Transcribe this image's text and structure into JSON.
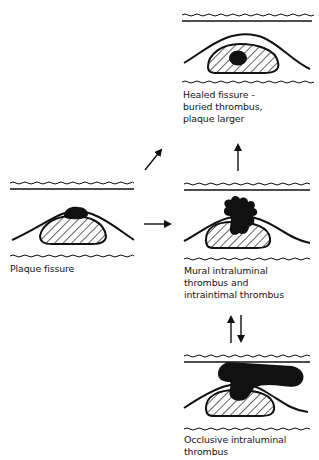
{
  "diagram": {
    "type": "flow",
    "colors": {
      "ink": "#111111",
      "background": "#ffffff"
    },
    "stages": [
      {
        "id": "plaque-fissure",
        "label_lines": [
          "Plaque fissure"
        ]
      },
      {
        "id": "healed-fissure",
        "label_lines": [
          "Healed fissure -",
          "buried thrombus,",
          "plaque larger"
        ]
      },
      {
        "id": "mural-thrombus",
        "label_lines": [
          "Mural intraluminal",
          "thrombus and",
          "intraintimal thrombus"
        ]
      },
      {
        "id": "occlusive-thrombus",
        "label_lines": [
          "Occlusive intraluminal",
          "thrombus"
        ]
      }
    ],
    "arrows": [
      {
        "from": "plaque-fissure",
        "to": "healed-fissure",
        "direction": "up-right"
      },
      {
        "from": "plaque-fissure",
        "to": "mural-thrombus",
        "direction": "right"
      },
      {
        "from": "mural-thrombus",
        "to": "healed-fissure",
        "direction": "up"
      },
      {
        "from": "mural-thrombus",
        "to": "occlusive-thrombus",
        "direction": "down"
      },
      {
        "from": "occlusive-thrombus",
        "to": "mural-thrombus",
        "direction": "up"
      }
    ]
  }
}
